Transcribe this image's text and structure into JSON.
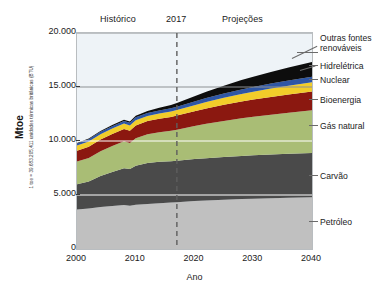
{
  "figure": {
    "axis_labels": {
      "x": "Ano",
      "y": "Mtoe",
      "y_sub": "1 toe = 39.683.205,411 unidades térmicas britânicas (BTU)"
    },
    "headers": {
      "historico": "Histórico",
      "year_marker": "2017",
      "projecoes": "Projeções"
    }
  },
  "chart_data": {
    "type": "area",
    "title": "",
    "xlabel": "Ano",
    "ylabel": "Mtoe",
    "xlim": [
      2000,
      2040
    ],
    "ylim": [
      0,
      20000
    ],
    "xticks": [
      "2000",
      "2010",
      "2020",
      "2030",
      "2040"
    ],
    "xtick_values": [
      2000,
      2010,
      2020,
      2030,
      2040
    ],
    "yticks": [
      "0",
      "5.000",
      "10.000",
      "15.000",
      "20.000"
    ],
    "ytick_values": [
      0,
      5000,
      10000,
      15000,
      20000
    ],
    "grid": true,
    "legend_position": "right",
    "annotations": [
      {
        "label": "Histórico",
        "x": 2007
      },
      {
        "label": "2017",
        "x": 2017,
        "type": "vertical-dashed-line"
      },
      {
        "label": "Projeções",
        "x": 2027
      }
    ],
    "stack_order_bottom_to_top": [
      "Petróleo",
      "Carvão",
      "Gás natural",
      "Bioenergia",
      "Nuclear",
      "Hidrelétrica",
      "Outras fontes renováveis"
    ],
    "x": [
      2000,
      2002,
      2004,
      2006,
      2008,
      2009,
      2010,
      2012,
      2014,
      2016,
      2017,
      2020,
      2022,
      2025,
      2028,
      2030,
      2033,
      2036,
      2040
    ],
    "series": [
      {
        "name": "Petróleo",
        "color": "#c0c0c0",
        "values": [
          3650,
          3760,
          3900,
          3990,
          4070,
          4000,
          4100,
          4170,
          4230,
          4300,
          4340,
          4450,
          4500,
          4570,
          4630,
          4660,
          4700,
          4740,
          4790
        ]
      },
      {
        "name": "Carvão",
        "color": "#4a4a4a",
        "values": [
          2350,
          2480,
          2850,
          3150,
          3400,
          3400,
          3600,
          3800,
          3850,
          3820,
          3830,
          3880,
          3910,
          3950,
          3990,
          4010,
          4040,
          4070,
          4100
        ]
      },
      {
        "name": "Gás natural",
        "color": "#a9bd75",
        "values": [
          2100,
          2190,
          2300,
          2400,
          2500,
          2420,
          2560,
          2660,
          2720,
          2820,
          2880,
          3050,
          3180,
          3340,
          3490,
          3580,
          3700,
          3810,
          3950
        ]
      },
      {
        "name": "Bioenergia",
        "color": "#8b1810",
        "values": [
          1000,
          1040,
          1080,
          1110,
          1150,
          1140,
          1180,
          1220,
          1260,
          1290,
          1310,
          1380,
          1430,
          1490,
          1550,
          1590,
          1640,
          1690,
          1750
        ]
      },
      {
        "name": "Nuclear",
        "color": "#f2cd2a",
        "values": [
          480,
          490,
          500,
          500,
          490,
          480,
          490,
          460,
          480,
          500,
          510,
          560,
          600,
          650,
          700,
          730,
          770,
          800,
          840
        ]
      },
      {
        "name": "Hidrelétrica",
        "color": "#2e56a5",
        "values": [
          190,
          200,
          215,
          225,
          240,
          245,
          260,
          275,
          290,
          300,
          310,
          340,
          360,
          390,
          420,
          440,
          465,
          490,
          520
        ]
      },
      {
        "name": "Outras fontes renováveis",
        "color": "#0d0d0d",
        "values": [
          55,
          65,
          80,
          95,
          120,
          130,
          150,
          200,
          250,
          310,
          350,
          480,
          580,
          720,
          860,
          950,
          1080,
          1200,
          1360
        ]
      }
    ]
  },
  "legend": [
    {
      "label": "Outras fontes",
      "label2": "renováveis",
      "name": "outras-fontes-renovaveis"
    },
    {
      "label": "Hidrelétrica",
      "name": "hidreletrica"
    },
    {
      "label": "Nuclear",
      "name": "nuclear"
    },
    {
      "label": "Bioenergia",
      "name": "bioenergia"
    },
    {
      "label": "Gás natural",
      "name": "gas-natural"
    },
    {
      "label": "Carvão",
      "name": "carvao"
    },
    {
      "label": "Petróleo",
      "name": "petroleo"
    }
  ]
}
